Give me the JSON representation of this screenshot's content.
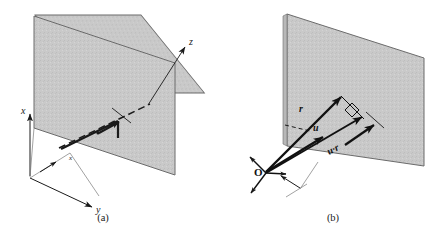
{
  "figure": {
    "background_color": "#ffffff",
    "plane_fill": "#c9c9c9",
    "plane_stroke": "#6b6b6b",
    "line_color": "#1a1a1a",
    "panels": [
      {
        "id": "panel-a",
        "caption": "(a)",
        "axes": [
          {
            "name": "x-axis",
            "label": "x"
          },
          {
            "name": "y-axis",
            "label": "y"
          },
          {
            "name": "z-axis",
            "label": "z"
          }
        ],
        "inline_label": "x",
        "elements": [
          "shaded-plane",
          "dashed-hidden-edge",
          "thick-line-segment",
          "normal-arrow",
          "origin-corner"
        ]
      },
      {
        "id": "panel-b",
        "caption": "(b)",
        "origin_label": "O",
        "vectors": [
          {
            "name": "vector-r",
            "label": "r"
          },
          {
            "name": "vector-u",
            "label": "u"
          },
          {
            "name": "projection-u-dot-r",
            "label": "u·r"
          }
        ],
        "elements": [
          "shaded-plane",
          "right-angle-marker",
          "axis-cross-at-origin",
          "dimension-arrows",
          "normal-arrow"
        ]
      }
    ]
  }
}
